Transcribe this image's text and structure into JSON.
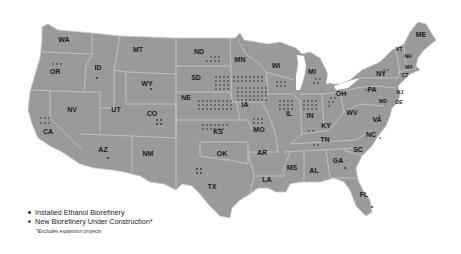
{
  "map": {
    "title": "US Ethanol Biorefinery Locations",
    "state_labels": [
      {
        "abbr": "WA",
        "x": 64,
        "y": 42
      },
      {
        "abbr": "OR",
        "x": 55,
        "y": 74
      },
      {
        "abbr": "ID",
        "x": 98,
        "y": 70
      },
      {
        "abbr": "MT",
        "x": 138,
        "y": 52
      },
      {
        "abbr": "WY",
        "x": 147,
        "y": 86
      },
      {
        "abbr": "NV",
        "x": 72,
        "y": 112
      },
      {
        "abbr": "UT",
        "x": 116,
        "y": 112
      },
      {
        "abbr": "CO",
        "x": 152,
        "y": 116
      },
      {
        "abbr": "CA",
        "x": 48,
        "y": 134
      },
      {
        "abbr": "AZ",
        "x": 103,
        "y": 152
      },
      {
        "abbr": "NM",
        "x": 148,
        "y": 156
      },
      {
        "abbr": "ND",
        "x": 199,
        "y": 54
      },
      {
        "abbr": "SD",
        "x": 196,
        "y": 80
      },
      {
        "abbr": "NE",
        "x": 186,
        "y": 100
      },
      {
        "abbr": "KS",
        "x": 218,
        "y": 134
      },
      {
        "abbr": "OK",
        "x": 222,
        "y": 156
      },
      {
        "abbr": "TX",
        "x": 212,
        "y": 189
      },
      {
        "abbr": "MN",
        "x": 240,
        "y": 62
      },
      {
        "abbr": "IA",
        "x": 245,
        "y": 107
      },
      {
        "abbr": "MO",
        "x": 259,
        "y": 132
      },
      {
        "abbr": "AR",
        "x": 262,
        "y": 155
      },
      {
        "abbr": "LA",
        "x": 267,
        "y": 182
      },
      {
        "abbr": "WI",
        "x": 276,
        "y": 68
      },
      {
        "abbr": "IL",
        "x": 289,
        "y": 116
      },
      {
        "abbr": "MI",
        "x": 312,
        "y": 74
      },
      {
        "abbr": "IN",
        "x": 310,
        "y": 118
      },
      {
        "abbr": "OH",
        "x": 341,
        "y": 96
      },
      {
        "abbr": "KY",
        "x": 326,
        "y": 128
      },
      {
        "abbr": "TN",
        "x": 325,
        "y": 142
      },
      {
        "abbr": "MS",
        "x": 292,
        "y": 170
      },
      {
        "abbr": "AL",
        "x": 314,
        "y": 173
      },
      {
        "abbr": "GA",
        "x": 338,
        "y": 163
      },
      {
        "abbr": "FL",
        "x": 364,
        "y": 197
      },
      {
        "abbr": "SC",
        "x": 358,
        "y": 152
      },
      {
        "abbr": "NC",
        "x": 371,
        "y": 137
      },
      {
        "abbr": "VA",
        "x": 377,
        "y": 122
      },
      {
        "abbr": "WV",
        "x": 352,
        "y": 115
      },
      {
        "abbr": "PA",
        "x": 372,
        "y": 92
      },
      {
        "abbr": "NY",
        "x": 381,
        "y": 76
      },
      {
        "abbr": "ME",
        "x": 421,
        "y": 37
      },
      {
        "abbr": "VT",
        "x": 399,
        "y": 51
      },
      {
        "abbr": "NH",
        "x": 408,
        "y": 58
      },
      {
        "abbr": "MA",
        "x": 409,
        "y": 69
      },
      {
        "abbr": "CT",
        "x": 405,
        "y": 77
      },
      {
        "abbr": "NJ",
        "x": 400,
        "y": 94
      },
      {
        "abbr": "MD",
        "x": 383,
        "y": 103
      },
      {
        "abbr": "DE",
        "x": 399,
        "y": 104
      }
    ]
  },
  "legend": {
    "items": [
      {
        "label": "Installed Ethanol Biorefinery",
        "color": "#2a2a2a"
      },
      {
        "label": "New Biorefinery Under Construction*",
        "color": "#555555"
      }
    ],
    "note": "*Excludes expansion projects"
  },
  "colors": {
    "land": "#9a9a9a",
    "border": "#c8c8c8",
    "background": "#ffffff",
    "label": "#1a1a1a"
  }
}
